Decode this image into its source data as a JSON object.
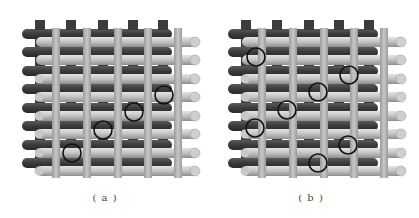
{
  "figure": {
    "panels": [
      {
        "id": "a",
        "caption": "( a )",
        "description": "3D woven fabric model with circled crossover points along a diagonal",
        "highlight_circles": [
          {
            "cx": 72,
            "cy": 153
          },
          {
            "cx": 103,
            "cy": 130
          },
          {
            "cx": 134,
            "cy": 112
          },
          {
            "cx": 164,
            "cy": 95
          }
        ]
      },
      {
        "id": "b",
        "caption": "( b )",
        "description": "3D woven fabric model with scattered circled crossover points",
        "highlight_circles": [
          {
            "cx": 50,
            "cy": 57
          },
          {
            "cx": 143,
            "cy": 75
          },
          {
            "cx": 112,
            "cy": 92
          },
          {
            "cx": 81,
            "cy": 110
          },
          {
            "cx": 49,
            "cy": 128
          },
          {
            "cx": 142,
            "cy": 145
          },
          {
            "cx": 112,
            "cy": 163
          }
        ]
      }
    ],
    "colors": {
      "dark_yarn": "#3c3c3c",
      "light_yarn": "#bdbdbd",
      "circle_stroke": "#111111",
      "background": "#ffffff"
    }
  }
}
